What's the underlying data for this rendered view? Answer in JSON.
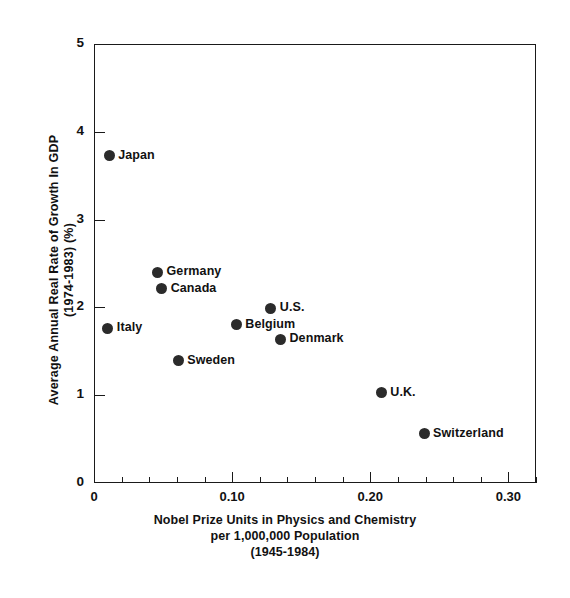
{
  "chart_data": {
    "type": "scatter",
    "title": "",
    "xlabel": "Nobel Prize Units in Physics and Chemistry per 1,000,000 Population (1945-1984)",
    "xlabel_lines": [
      "Nobel Prize Units in Physics and Chemistry",
      "per 1,000,000 Population",
      "(1945-1984)"
    ],
    "ylabel": "Average Annual Real Rate of Growth In GDP (1974-1983) (%)",
    "ylabel_lines": [
      "Average Annual Real Rate of Growth In GDP",
      "(1974-1983) (%)"
    ],
    "xlim": [
      0,
      0.32
    ],
    "ylim": [
      0,
      5
    ],
    "xticks": [
      0,
      0.1,
      0.2,
      0.3
    ],
    "xtick_labels": [
      "0",
      "0.10",
      "0.20",
      "0.30"
    ],
    "yticks": [
      0,
      1,
      2,
      3,
      4,
      5
    ],
    "ytick_labels": [
      "0",
      "1",
      "2",
      "3",
      "4",
      "5"
    ],
    "x_minor_tick_step": 0.02,
    "grid": false,
    "legend": "none",
    "marker": "filled-circle",
    "marker_color": "#2b2b2b",
    "points": [
      {
        "label": "Japan",
        "x": 0.011,
        "y": 3.73,
        "label_side": "right"
      },
      {
        "label": "Germany",
        "x": 0.046,
        "y": 2.4,
        "label_side": "right"
      },
      {
        "label": "Canada",
        "x": 0.049,
        "y": 2.21,
        "label_side": "right"
      },
      {
        "label": "Italy",
        "x": 0.01,
        "y": 1.76,
        "label_side": "right"
      },
      {
        "label": "Sweden",
        "x": 0.061,
        "y": 1.39,
        "label_side": "right"
      },
      {
        "label": "Belgium",
        "x": 0.103,
        "y": 1.8,
        "label_side": "right"
      },
      {
        "label": "U.S.",
        "x": 0.128,
        "y": 1.99,
        "label_side": "right"
      },
      {
        "label": "Denmark",
        "x": 0.135,
        "y": 1.64,
        "label_side": "right"
      },
      {
        "label": "U.K.",
        "x": 0.208,
        "y": 1.03,
        "label_side": "right"
      },
      {
        "label": "Switzerland",
        "x": 0.239,
        "y": 0.56,
        "label_side": "right"
      }
    ]
  }
}
